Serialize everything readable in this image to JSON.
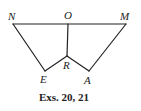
{
  "diagram": {
    "points": {
      "N": {
        "label": "N",
        "x": 13,
        "y": 24
      },
      "O": {
        "label": "O",
        "x": 68,
        "y": 24
      },
      "M": {
        "label": "M",
        "x": 126,
        "y": 24
      },
      "E": {
        "label": "E",
        "x": 45,
        "y": 71
      },
      "R": {
        "label": "R",
        "x": 67,
        "y": 56
      },
      "A": {
        "label": "A",
        "x": 89,
        "y": 71
      }
    },
    "segments": [
      [
        "N",
        "M"
      ],
      [
        "N",
        "E"
      ],
      [
        "E",
        "R"
      ],
      [
        "R",
        "A"
      ],
      [
        "A",
        "M"
      ],
      [
        "O",
        "R"
      ]
    ],
    "caption": "Exs. 20, 21",
    "line_color": "#222222"
  }
}
